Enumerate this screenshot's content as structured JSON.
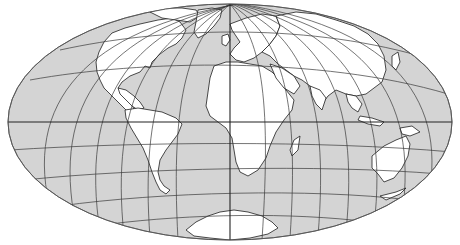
{
  "map": {
    "projection": "oblique equal-area (elliptical world map)",
    "colors": {
      "ocean": "#d4d4d4",
      "land": "#ffffff",
      "outline": "#1e1e1e",
      "graticule": "#3a3a3a"
    },
    "ellipse": {
      "cx": 230,
      "cy": 122,
      "rx": 222,
      "ry": 118
    },
    "continents": [
      {
        "id": "north-america",
        "label": "North America"
      },
      {
        "id": "greenland",
        "label": "Greenland"
      },
      {
        "id": "south-america",
        "label": "South America"
      },
      {
        "id": "europe",
        "label": "Europe"
      },
      {
        "id": "africa",
        "label": "Africa"
      },
      {
        "id": "madagascar",
        "label": "Madagascar"
      },
      {
        "id": "asia",
        "label": "Asia"
      },
      {
        "id": "arabia",
        "label": "Arabia"
      },
      {
        "id": "india",
        "label": "India"
      },
      {
        "id": "southeast-asia",
        "label": "Southeast Asia"
      },
      {
        "id": "indonesia",
        "label": "Indonesia"
      },
      {
        "id": "new-guinea",
        "label": "New Guinea"
      },
      {
        "id": "australia",
        "label": "Australia"
      },
      {
        "id": "antarctica",
        "label": "Antarctica"
      },
      {
        "id": "british-isles",
        "label": "British Isles"
      },
      {
        "id": "japan",
        "label": "Japan"
      }
    ]
  }
}
